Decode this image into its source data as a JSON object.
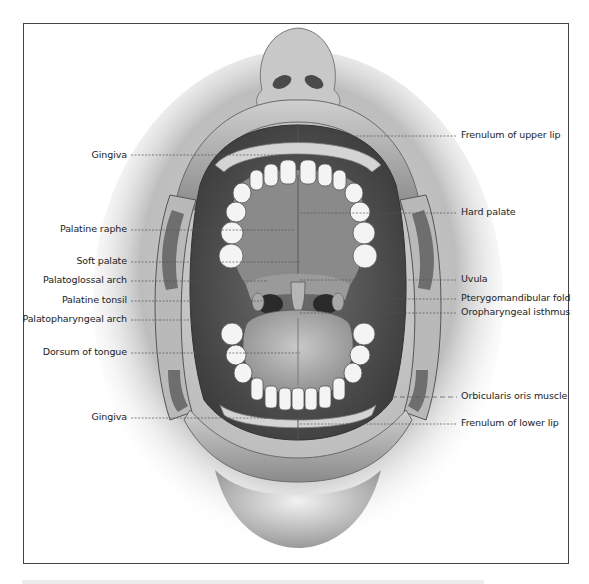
{
  "figure": {
    "frame_color": "#444444",
    "leader_line_color": "#555555"
  },
  "labels_left": [
    {
      "id": "gingiva-upper",
      "text": "Gingiva",
      "y": 155,
      "line_to": 300
    },
    {
      "id": "palatine-raphe",
      "text": "Palatine raphe",
      "y": 229,
      "line_to": 295
    },
    {
      "id": "soft-palate",
      "text": "Soft palate",
      "y": 261,
      "line_to": 300
    },
    {
      "id": "palatoglossal-arch",
      "text": "Palatoglossal arch",
      "y": 280,
      "line_to": 268
    },
    {
      "id": "palatine-tonsil",
      "text": "Palatine tonsil",
      "y": 300,
      "line_to": 262
    },
    {
      "id": "palatopharyngeal-arch",
      "text": "Palatopharyngeal arch",
      "y": 319,
      "line_to": 250
    },
    {
      "id": "dorsum-of-tongue",
      "text": "Dorsum of tongue",
      "y": 352,
      "line_to": 300
    },
    {
      "id": "gingiva-lower",
      "text": "Gingiva",
      "y": 417,
      "line_to": 268
    }
  ],
  "labels_right": [
    {
      "id": "frenulum-upper-lip",
      "text": "Frenulum of upper lip",
      "y": 135,
      "line_from": 300
    },
    {
      "id": "hard-palate",
      "text": "Hard palate",
      "y": 212,
      "line_from": 300
    },
    {
      "id": "uvula",
      "text": "Uvula",
      "y": 279,
      "line_from": 300
    },
    {
      "id": "pterygomandibular-fold",
      "text": "Pterygomandibular fold",
      "y": 298,
      "line_from": 370
    },
    {
      "id": "oropharyngeal-isthmus",
      "text": "Oropharyngeal isthmus",
      "y": 312,
      "line_from": 300
    },
    {
      "id": "orbicularis-oris-muscle",
      "text": "Orbicularis oris muscle",
      "y": 396,
      "line_from": 392
    },
    {
      "id": "frenulum-lower-lip",
      "text": "Frenulum of lower lip",
      "y": 423,
      "line_from": 300
    }
  ]
}
